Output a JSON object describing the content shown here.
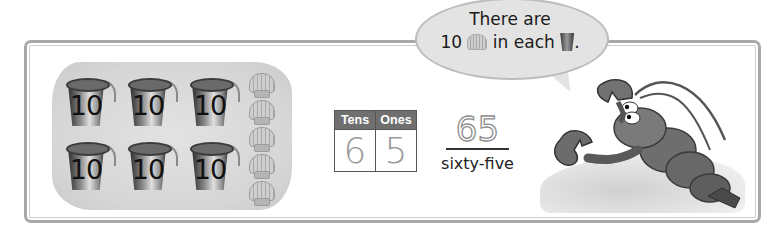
{
  "bubble": {
    "line1": "There are",
    "line2_prefix": "10",
    "line2_mid": "in each",
    "line2_suffix": ".",
    "icons": [
      "shell-icon",
      "bucket-icon"
    ]
  },
  "buckets": {
    "count": 6,
    "label": "10",
    "labels": [
      "10",
      "10",
      "10",
      "10",
      "10",
      "10"
    ]
  },
  "shells": {
    "count": 5
  },
  "place_value_table": {
    "headers": [
      "Tens",
      "Ones"
    ],
    "values": [
      "6",
      "5"
    ]
  },
  "number": {
    "numeral": "65",
    "word": "sixty-five"
  },
  "character": "lobster",
  "colors": {
    "frame_border": "#a9a9a9",
    "table_header": "#6f6f6f",
    "bubble_fill": "#e3e3e3",
    "sand": "#d6d6d6"
  }
}
